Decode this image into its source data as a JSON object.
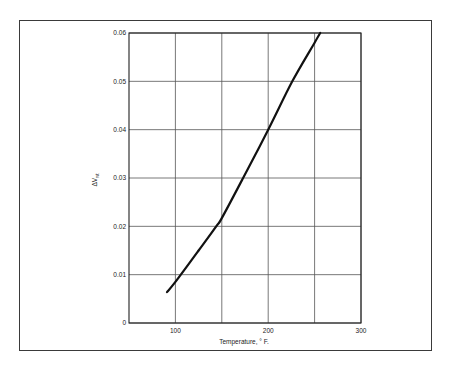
{
  "chart_data": {
    "type": "line",
    "title": "",
    "xlabel": "Temperature, ° F.",
    "ylabel": "ΔV_wt",
    "xlim": [
      50,
      300
    ],
    "ylim": [
      0,
      0.06
    ],
    "grid": true,
    "legend": null,
    "x_ticks": [
      100,
      200,
      300
    ],
    "x_tick_labels": [
      "100",
      "200",
      "300"
    ],
    "x_gridlines": [
      100,
      150,
      200,
      250,
      300
    ],
    "y_ticks": [
      0,
      0.01,
      0.02,
      0.03,
      0.04,
      0.05,
      0.06
    ],
    "y_tick_labels": [
      "0",
      "0.01",
      "0.02",
      "0.03",
      "0.04",
      "0.05",
      "0.06"
    ],
    "series": [
      {
        "name": "ΔV_wt vs Temperature",
        "x": [
          91,
          100,
          125,
          144,
          150,
          173,
          200,
          226,
          250,
          256
        ],
        "y": [
          0.0064,
          0.0085,
          0.015,
          0.02,
          0.0217,
          0.03,
          0.04,
          0.05,
          0.058,
          0.06
        ]
      }
    ]
  },
  "axes": {
    "xlabel": "Temperature, ° F.",
    "ylabel_main": "ΔV",
    "ylabel_sub": "wt"
  }
}
